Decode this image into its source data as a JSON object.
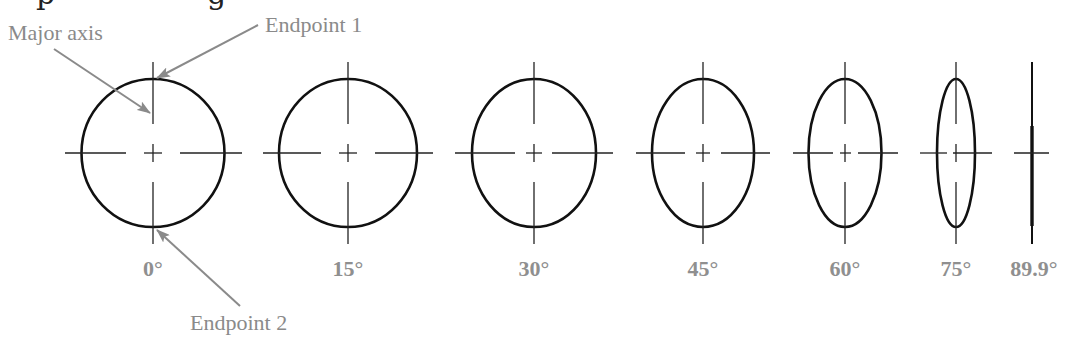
{
  "caption_fragment": {
    "glyphs": [
      "p",
      "g"
    ]
  },
  "callouts": {
    "major_axis": "Major axis",
    "endpoint_1": "Endpoint 1",
    "endpoint_2": "Endpoint 2"
  },
  "ellipses": [
    {
      "label": "0°",
      "cx": 153,
      "rx": 71.5,
      "ry": 74
    },
    {
      "label": "15°",
      "cx": 348,
      "rx": 69,
      "ry": 74
    },
    {
      "label": "30°",
      "cx": 534,
      "rx": 62,
      "ry": 74
    },
    {
      "label": "45°",
      "cx": 703,
      "rx": 51,
      "ry": 74
    },
    {
      "label": "60°",
      "cx": 845,
      "rx": 36.5,
      "ry": 74
    },
    {
      "label": "75°",
      "cx": 956,
      "rx": 19,
      "ry": 74
    },
    {
      "label": "89.9°",
      "cx": 1032,
      "rx": 1.5,
      "ry": 74
    }
  ],
  "colors": {
    "ellipse": "#111111",
    "callout": "#8a8a8a",
    "label": "#8f8f8f"
  }
}
